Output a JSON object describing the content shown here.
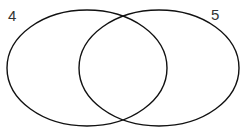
{
  "diagram": {
    "type": "venn",
    "sets": [
      {
        "label": "4",
        "cx": 87,
        "cy": 68,
        "rx": 80,
        "ry": 58
      },
      {
        "label": "5",
        "cx": 159,
        "cy": 68,
        "rx": 80,
        "ry": 58
      }
    ],
    "stroke_color": "#111111",
    "background": "#ffffff"
  }
}
